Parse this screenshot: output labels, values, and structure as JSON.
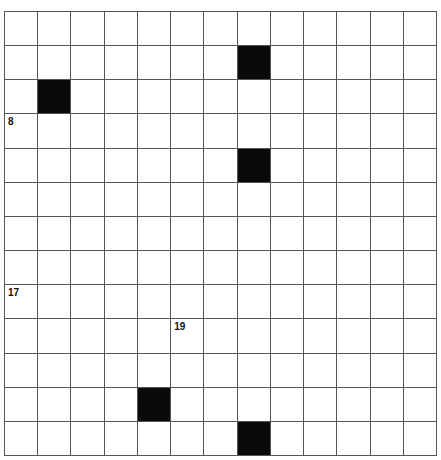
{
  "puzzle": {
    "rows": 13,
    "cols": 13,
    "black_cells": [
      [
        1,
        7
      ],
      [
        2,
        1
      ],
      [
        4,
        7
      ],
      [
        11,
        4
      ],
      [
        12,
        7
      ]
    ],
    "numbered_cells": [
      {
        "row": 3,
        "col": 0,
        "number": "8"
      },
      {
        "row": 8,
        "col": 0,
        "number": "17"
      },
      {
        "row": 9,
        "col": 5,
        "number": "19"
      }
    ]
  },
  "colors": {
    "black": "#0a0a0a",
    "white": "#ffffff",
    "grid_line": "#555555"
  }
}
